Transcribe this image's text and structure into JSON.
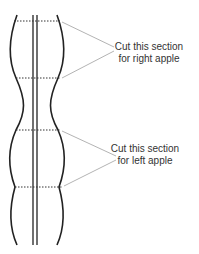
{
  "diagram": {
    "annotations": [
      {
        "line1": "Cut this section",
        "line2": "for right apple"
      },
      {
        "line1": "Cut this section",
        "line2": "for left apple"
      }
    ],
    "colors": {
      "outline": "#222222",
      "dashed": "#333333",
      "arrow": "#aaaaaa",
      "text": "#333333"
    }
  }
}
